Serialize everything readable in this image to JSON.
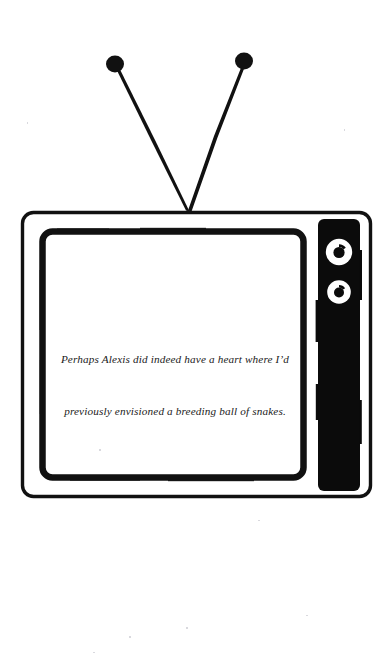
{
  "artwork": {
    "title": "Television illustration with rabbit-ear antenna",
    "style": "black-and-white line drawing",
    "background_color": "#ffffff",
    "ink_color": "#000000"
  },
  "television": {
    "outer_frame": {
      "label": "tv-outer-frame"
    },
    "screen": {
      "label": "tv-screen",
      "background_color": "#ffffff",
      "border_color": "#000000"
    },
    "control_panel": {
      "label": "tv-control-panel",
      "fill_color": "#0b0b0b",
      "knobs": [
        {
          "name": "tuner-knob-upper",
          "ring_color": "#ffffff",
          "center_color": "#0b0b0b"
        },
        {
          "name": "tuner-knob-lower",
          "ring_color": "#ffffff",
          "center_color": "#0b0b0b"
        }
      ]
    },
    "antenna": {
      "label": "tv-antenna",
      "rods": [
        {
          "name": "antenna-rod-left",
          "tip": "antenna-tip-left"
        },
        {
          "name": "antenna-rod-right",
          "tip": "antenna-tip-right"
        }
      ]
    }
  },
  "screen_caption": {
    "lines": [
      "Perhaps Alexis did indeed have a heart where I’d",
      "previously envisioned a breeding ball of snakes."
    ],
    "full_text": "Perhaps Alexis did indeed have a heart where I’d previously envisioned a breeding ball of snakes."
  }
}
